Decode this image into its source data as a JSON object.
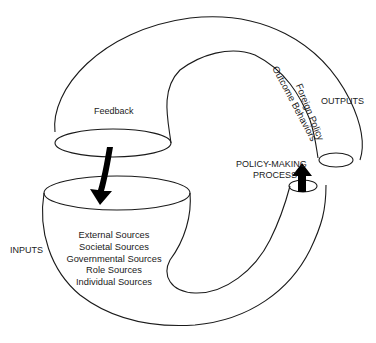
{
  "diagram": {
    "labels": {
      "feedback": "Feedback",
      "inputs": "INPUTS",
      "outputs": "OUTPUTS",
      "process_line1": "POLICY-MAKING",
      "process_line2": "PROCESS",
      "output_line1": "Foreign Policy",
      "output_line2": "Outcome Behaviors"
    },
    "input_sources": [
      "External Sources",
      "Societal Sources",
      "Governmental Sources",
      "Role Sources",
      "Individual Sources"
    ],
    "colors": {
      "stroke": "#1a1a1a",
      "arrow": "#000000",
      "background": "#ffffff"
    }
  }
}
